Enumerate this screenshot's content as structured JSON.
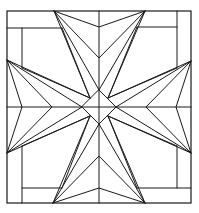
{
  "diagram": {
    "title": "Maltese cross quilt block pattern",
    "type": "geometric line drawing",
    "stroke_color": "#1a1a1a",
    "background_color": "#ffffff",
    "frame": {
      "x1": 7,
      "y1": 11,
      "x2": 191,
      "y2": 203
    },
    "center": [
      99,
      107
    ],
    "center_diamond": [
      [
        99,
        90
      ],
      [
        116,
        107
      ],
      [
        99,
        124
      ],
      [
        82,
        107
      ]
    ],
    "arms": [
      "top",
      "right",
      "bottom",
      "left"
    ]
  }
}
